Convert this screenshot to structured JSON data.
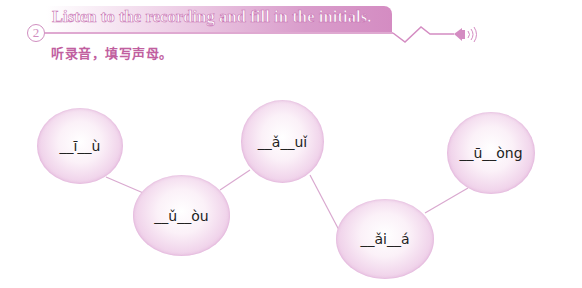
{
  "header": {
    "number": "2",
    "title": "Listen to the recording and fill in the initials.",
    "subtitle": "听录音，填写声母。",
    "icon": "speaker-icon",
    "accent_color": "#d48cc2"
  },
  "bubbles": [
    {
      "text": "__ī__ù"
    },
    {
      "text": "__ǔ__òu"
    },
    {
      "text": "__ǎ__uǐ"
    },
    {
      "text": "__ǎi__á"
    },
    {
      "text": "__ū__òng"
    }
  ]
}
